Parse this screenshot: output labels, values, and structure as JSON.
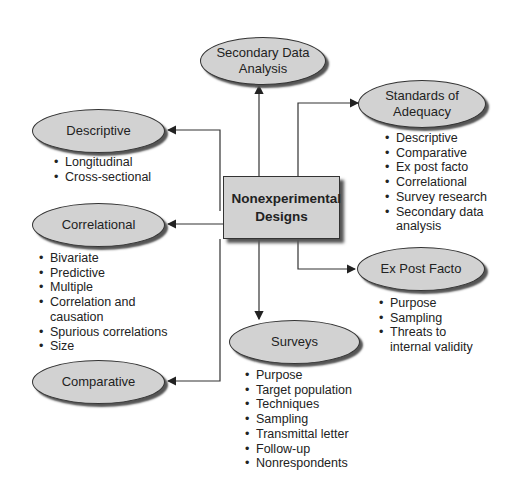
{
  "center": {
    "title": "Nonexperimental Designs"
  },
  "nodes": {
    "secondary": {
      "label": "Secondary Data Analysis",
      "items": []
    },
    "standards": {
      "label": "Standards of Adequacy",
      "items": [
        "Descriptive",
        "Comparative",
        "Ex post facto",
        "Correlational",
        "Survey research",
        "Secondary data analysis"
      ]
    },
    "descriptive": {
      "label": "Descriptive",
      "items": [
        "Longitudinal",
        "Cross-sectional"
      ]
    },
    "correlational": {
      "label": "Correlational",
      "items": [
        "Bivariate",
        "Predictive",
        "Multiple",
        "Correlation and causation",
        "Spurious correlations",
        "Size"
      ]
    },
    "expost": {
      "label": "Ex Post Facto",
      "items": [
        "Purpose",
        "Sampling",
        "Threats to internal validity"
      ]
    },
    "surveys": {
      "label": "Surveys",
      "items": [
        "Purpose",
        "Target population",
        "Techniques",
        "Sampling",
        "Transmittal letter",
        "Follow-up",
        "Nonrespondents"
      ]
    },
    "comparative": {
      "label": "Comparative",
      "items": []
    }
  },
  "colors": {
    "node_fill": "#d2d2d2",
    "line": "#333333"
  }
}
